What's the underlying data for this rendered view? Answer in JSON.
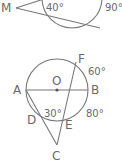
{
  "figure_1": {
    "point_label": "M",
    "angles": [
      "40°",
      "90°"
    ]
  },
  "figure_2": {
    "points": {
      "O": "O",
      "A": "A",
      "B": "B",
      "F": "F",
      "D": "D",
      "E": "E",
      "C": "C"
    },
    "angles": {
      "inner": "30°",
      "arc_fb": "60°",
      "arc_be": "80°"
    }
  },
  "colors": {
    "stroke": "#777777",
    "text": "#6a6a6a",
    "background": "#ffffff"
  }
}
